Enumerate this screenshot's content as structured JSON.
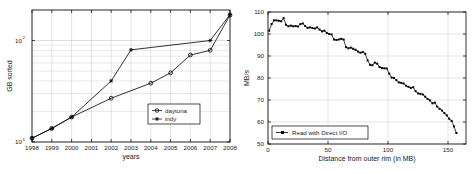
{
  "figure": {
    "background": "#ffffff",
    "axis_color": "#000000",
    "grid_color": "#c8c8c8",
    "series_color": "#000000"
  },
  "chart_data": [
    {
      "id": "sort-benchmark",
      "type": "line",
      "title": "",
      "xlabel": "years",
      "ylabel": "GB sorted",
      "yscale": "log",
      "ylim": [
        10,
        200
      ],
      "xlim": [
        1998,
        2008
      ],
      "grid": true,
      "legend_position": "lower-right",
      "xticks": [
        "1998",
        "1999",
        "2000",
        "2001",
        "2002",
        "2003",
        "2004",
        "2005",
        "2006",
        "2007",
        "2008"
      ],
      "yticks": [
        "10^1",
        "10^2"
      ],
      "ytick_mantissa": "10",
      "ytick_exponents": [
        "1",
        "2"
      ],
      "x": [
        1998,
        1999,
        2000,
        2001,
        2002,
        2003,
        2004,
        2005,
        2006,
        2007,
        2008
      ],
      "series": [
        {
          "name": "daytona",
          "marker": "circle",
          "x": [
            1998,
            1999,
            2000,
            2002,
            2004,
            2005,
            2006,
            2007,
            2008
          ],
          "values": [
            10.9,
            13.6,
            17.6,
            27.0,
            38.0,
            48.0,
            72.0,
            80.0,
            178.0
          ]
        },
        {
          "name": "indy",
          "marker": "star",
          "x": [
            1998,
            1999,
            2000,
            2002,
            2003,
            2007,
            2008
          ],
          "values": [
            10.9,
            13.6,
            17.6,
            40.0,
            81.0,
            100.0,
            180.0
          ]
        }
      ],
      "legend": [
        "daytona",
        "indy"
      ]
    },
    {
      "id": "disk-read-throughput",
      "type": "line",
      "title": "",
      "xlabel": "Distance from outer rim (in MB)",
      "ylabel": "MB/s",
      "yscale": "linear",
      "ylim": [
        50,
        110
      ],
      "xlim": [
        0,
        165
      ],
      "grid": true,
      "legend_position": "lower-left",
      "xticks": [
        "0",
        "50",
        "100",
        "150"
      ],
      "yticks": [
        "50",
        "60",
        "70",
        "80",
        "90",
        "100",
        "110"
      ],
      "legend": [
        "Read with Direct I/O"
      ],
      "series": [
        {
          "name": "Read with Direct I/O",
          "marker": "square",
          "x": [
            1,
            3,
            5,
            7,
            9,
            11,
            13,
            15,
            17,
            19,
            21,
            23,
            25,
            27,
            29,
            31,
            33,
            35,
            37,
            39,
            41,
            43,
            45,
            47,
            49,
            51,
            53,
            55,
            57,
            59,
            61,
            63,
            65,
            67,
            69,
            71,
            73,
            75,
            77,
            79,
            81,
            83,
            85,
            87,
            89,
            91,
            93,
            95,
            97,
            99,
            101,
            103,
            105,
            107,
            109,
            111,
            113,
            115,
            117,
            119,
            121,
            123,
            125,
            127,
            129,
            131,
            133,
            135,
            137,
            139,
            141,
            143,
            145,
            147,
            149,
            151,
            153,
            155,
            157
          ],
          "values": [
            101.5,
            104.5,
            106.2,
            106.2,
            106.0,
            105.8,
            107.2,
            104.2,
            103.5,
            103.8,
            103.5,
            103.6,
            103.4,
            104.5,
            104.8,
            103.6,
            102.8,
            103.0,
            102.7,
            102.5,
            103.0,
            102.0,
            101.2,
            101.5,
            100.5,
            100.0,
            99.8,
            97.5,
            97.3,
            97.5,
            97.8,
            97.5,
            94.0,
            93.5,
            93.8,
            93.3,
            92.8,
            92.0,
            91.5,
            91.8,
            91.0,
            88.0,
            86.0,
            85.8,
            87.0,
            86.5,
            85.0,
            84.5,
            84.4,
            84.3,
            82.0,
            80.2,
            80.0,
            79.0,
            78.0,
            77.8,
            77.5,
            76.5,
            76.0,
            75.5,
            75.8,
            74.0,
            73.0,
            72.8,
            72.5,
            71.5,
            70.5,
            69.8,
            68.5,
            68.8,
            67.0,
            66.0,
            65.2,
            64.0,
            63.0,
            61.5,
            60.5,
            58.0,
            55.0
          ]
        }
      ]
    }
  ]
}
